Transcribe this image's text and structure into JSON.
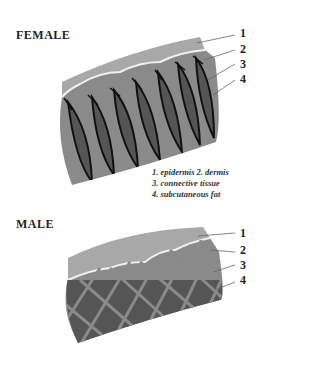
{
  "female": {
    "title": "FEMALE",
    "labels": [
      "1",
      "2",
      "3",
      "4"
    ]
  },
  "male": {
    "title": "MALE",
    "labels": [
      "1",
      "2",
      "3",
      "4"
    ]
  },
  "legend": {
    "line1": "1. epidermis 2. dermis",
    "line2": "3. connective tissue",
    "line3": "4. subcutaneous fat"
  },
  "colors": {
    "epidermis": "#a8a8a8",
    "dermis": "#8a8a8a",
    "fat": "#555555",
    "septa": "#111111",
    "boundary": "#f0f0f0"
  }
}
